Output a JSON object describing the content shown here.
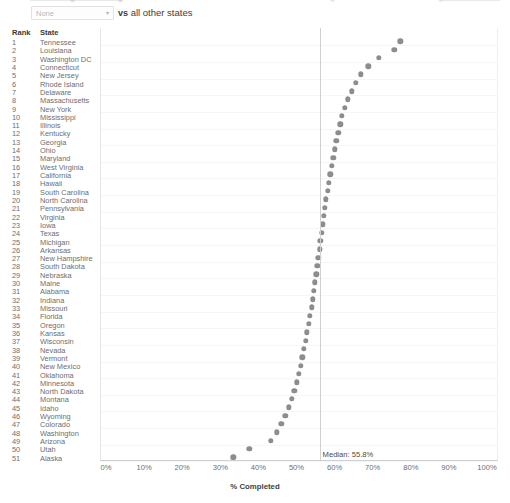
{
  "control_bar": {
    "select_name": "state-compare-select",
    "select_value": "",
    "select_placeholder": "None",
    "caret_glyph": "▾",
    "vs_strong": "vs",
    "vs_rest": " all other states"
  },
  "list": {
    "header_rank": "Rank",
    "header_state": "State"
  },
  "chart_data": {
    "type": "scatter",
    "orientation": "horizontal-dotplot",
    "title": "",
    "xlabel": "% Completed",
    "ylabel": "",
    "xlim": [
      0,
      100
    ],
    "xticks": [
      "0%",
      "10%",
      "20%",
      "30%",
      "40%",
      "50%",
      "60%",
      "70%",
      "80%",
      "90%",
      "100%"
    ],
    "xtick_values": [
      0,
      10,
      20,
      30,
      40,
      50,
      60,
      70,
      80,
      90,
      100
    ],
    "grid": true,
    "legend": "none",
    "dot_color": "#8d8d8d",
    "median_value": 55.8,
    "median_label": "Median: 55.8%",
    "categories": [
      "Tennessee",
      "Louisiana",
      "Washington DC",
      "Connecticut",
      "New Jersey",
      "Rhode Island",
      "Delaware",
      "Massachusetts",
      "New York",
      "Mississippi",
      "Illinois",
      "Kentucky",
      "Georgia",
      "Ohio",
      "Maryland",
      "West Virginia",
      "California",
      "Hawaii",
      "South Carolina",
      "North Carolina",
      "Pennsylvania",
      "Virginia",
      "Iowa",
      "Texas",
      "Michigan",
      "Arkansas",
      "New Hampshire",
      "South Dakota",
      "Nebraska",
      "Maine",
      "Alabama",
      "Indiana",
      "Missouri",
      "Florida",
      "Oregon",
      "Kansas",
      "Wisconsin",
      "Nevada",
      "Vermont",
      "New Mexico",
      "Oklahoma",
      "Minnesota",
      "North Dakota",
      "Montana",
      "Idaho",
      "Wyoming",
      "Colorado",
      "Washington",
      "Arizona",
      "Utah",
      "Alaska"
    ],
    "ranks": [
      1,
      2,
      3,
      4,
      5,
      6,
      7,
      8,
      9,
      10,
      11,
      12,
      13,
      14,
      15,
      16,
      17,
      18,
      19,
      20,
      21,
      22,
      23,
      24,
      25,
      26,
      27,
      28,
      29,
      30,
      31,
      32,
      33,
      34,
      35,
      36,
      37,
      38,
      39,
      40,
      41,
      42,
      43,
      44,
      45,
      46,
      47,
      48,
      49,
      50,
      51
    ],
    "values": [
      77.0,
      75.4,
      71.3,
      68.6,
      66.6,
      65.3,
      64.3,
      63.2,
      62.4,
      61.7,
      61.2,
      60.7,
      60.2,
      59.8,
      59.4,
      59.0,
      58.6,
      58.2,
      57.9,
      57.5,
      57.2,
      56.9,
      56.6,
      56.3,
      56.0,
      55.8,
      55.5,
      55.2,
      54.9,
      54.6,
      54.3,
      54.0,
      53.7,
      53.3,
      52.9,
      52.5,
      52.1,
      51.7,
      51.3,
      50.8,
      50.3,
      49.8,
      49.2,
      48.5,
      47.7,
      46.8,
      45.8,
      44.6,
      43.0,
      37.4,
      33.2
    ]
  }
}
